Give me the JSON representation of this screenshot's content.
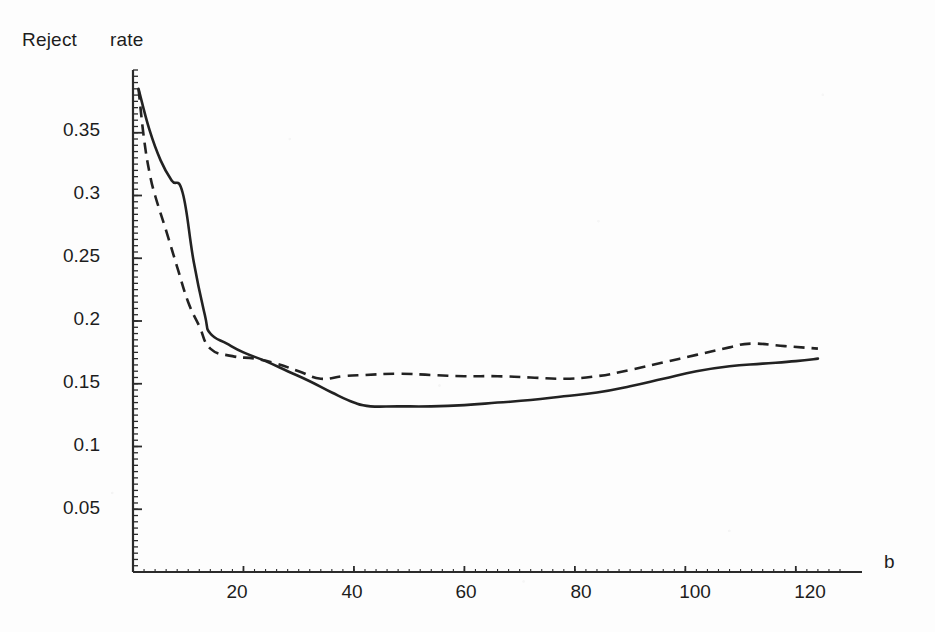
{
  "chart_data": {
    "type": "line",
    "title": "Reject      rate",
    "title_words": [
      "Reject",
      "rate"
    ],
    "xlabel": "b",
    "ylabel": "",
    "xlim": [
      0,
      128
    ],
    "ylim": [
      0,
      0.4
    ],
    "grid": false,
    "legend": "none",
    "xticks": [
      20,
      40,
      60,
      80,
      100,
      120
    ],
    "xtick_labels": [
      "20",
      "40",
      "60",
      "80",
      "100",
      "120"
    ],
    "yticks": [
      0.05,
      0.1,
      0.15,
      0.2,
      0.25,
      0.3,
      0.35
    ],
    "ytick_labels": [
      "0.05",
      "0.1",
      "0.15",
      "0.2",
      "0.25",
      "0.3",
      "0.35"
    ],
    "minor_ticks": true,
    "series": [
      {
        "name": "solid-curve",
        "style": "solid",
        "color": "#222222",
        "points": [
          [
            1,
            0.385
          ],
          [
            3,
            0.352
          ],
          [
            5,
            0.328
          ],
          [
            7,
            0.312
          ],
          [
            9,
            0.302
          ],
          [
            11,
            0.247
          ],
          [
            13,
            0.205
          ],
          [
            14,
            0.19
          ],
          [
            17,
            0.182
          ],
          [
            20,
            0.175
          ],
          [
            24,
            0.168
          ],
          [
            28,
            0.16
          ],
          [
            32,
            0.152
          ],
          [
            36,
            0.143
          ],
          [
            40,
            0.135
          ],
          [
            43,
            0.132
          ],
          [
            48,
            0.132
          ],
          [
            54,
            0.132
          ],
          [
            60,
            0.133
          ],
          [
            66,
            0.135
          ],
          [
            72,
            0.137
          ],
          [
            78,
            0.14
          ],
          [
            84,
            0.143
          ],
          [
            90,
            0.148
          ],
          [
            96,
            0.154
          ],
          [
            102,
            0.16
          ],
          [
            108,
            0.164
          ],
          [
            114,
            0.166
          ],
          [
            120,
            0.168
          ],
          [
            124,
            0.17
          ]
        ]
      },
      {
        "name": "dashed-curve",
        "style": "dashed",
        "color": "#222222",
        "points": [
          [
            1,
            0.385
          ],
          [
            2,
            0.345
          ],
          [
            3,
            0.318
          ],
          [
            4,
            0.3
          ],
          [
            6,
            0.272
          ],
          [
            8,
            0.243
          ],
          [
            10,
            0.215
          ],
          [
            12,
            0.196
          ],
          [
            14,
            0.178
          ],
          [
            18,
            0.172
          ],
          [
            22,
            0.17
          ],
          [
            26,
            0.166
          ],
          [
            30,
            0.16
          ],
          [
            34,
            0.154
          ],
          [
            38,
            0.156
          ],
          [
            42,
            0.157
          ],
          [
            48,
            0.158
          ],
          [
            54,
            0.157
          ],
          [
            60,
            0.156
          ],
          [
            66,
            0.156
          ],
          [
            72,
            0.155
          ],
          [
            78,
            0.154
          ],
          [
            84,
            0.156
          ],
          [
            90,
            0.161
          ],
          [
            96,
            0.167
          ],
          [
            102,
            0.173
          ],
          [
            108,
            0.179
          ],
          [
            112,
            0.182
          ],
          [
            118,
            0.18
          ],
          [
            124,
            0.178
          ]
        ]
      }
    ]
  },
  "axes_geometry": {
    "origin_px": [
      133,
      572
    ],
    "x_right_px": 862,
    "y_top_px": 70,
    "x_units_per_px": 0.1746,
    "y_value_at_top": 0.4
  }
}
